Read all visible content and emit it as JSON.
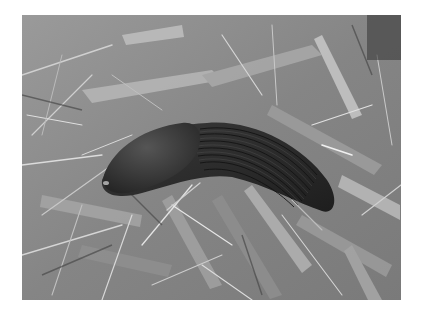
{
  "image": {
    "subject": "slug on grass and leaves",
    "description": "Grayscale photograph of a large ridged slug crawling diagonally across a bed of grass blades and fallen leaves",
    "palette": {
      "border": "#ffffff",
      "background_mid": "#8a8a8a",
      "grass_light": "#d8d8d8",
      "grass_dark": "#3c3c3c",
      "slug_body": "#2e2e2e",
      "slug_mantle": "#3a3a3a",
      "slug_ridges": "#1a1a1a"
    }
  }
}
